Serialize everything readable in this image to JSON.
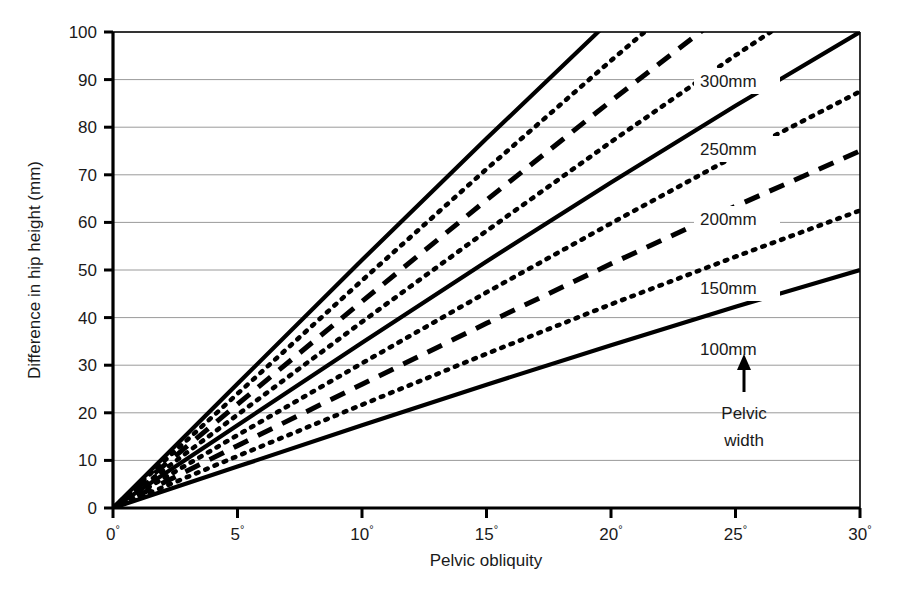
{
  "chart_data": {
    "type": "line",
    "title": "",
    "xlabel": "Pelvic obliquity",
    "ylabel": "Difference in hip height (mm)",
    "xlim": [
      0,
      30
    ],
    "ylim": [
      0,
      100
    ],
    "grid": true,
    "grid_axis": "y",
    "legend_position": "inline-right",
    "xticks": [
      "0",
      "5",
      "10",
      "15",
      "20",
      "25",
      "30"
    ],
    "xtick_values": [
      0,
      5,
      10,
      15,
      20,
      25,
      30
    ],
    "xtick_suffix": "°",
    "yticks": [
      "0",
      "10",
      "20",
      "30",
      "40",
      "50",
      "60",
      "70",
      "80",
      "90",
      "100"
    ],
    "ytick_values": [
      0,
      10,
      20,
      30,
      40,
      50,
      60,
      70,
      80,
      90,
      100
    ],
    "x": [
      0,
      5,
      10,
      15,
      20,
      25,
      30
    ],
    "series": [
      {
        "name": "300mm",
        "pelvic_width_mm": 300,
        "style": "solid",
        "label": "300mm",
        "values": [
          0,
          26.1,
          52.1,
          77.6,
          102.6,
          126.8,
          150.0
        ],
        "clipped_at_y": 100
      },
      {
        "name": "275mm",
        "pelvic_width_mm": 275,
        "style": "dotted",
        "label": "",
        "values": [
          0,
          24.0,
          47.8,
          71.2,
          94.0,
          116.2,
          137.5
        ],
        "clipped_at_y": 100
      },
      {
        "name": "250mm",
        "pelvic_width_mm": 250,
        "style": "dashed",
        "label": "250mm",
        "values": [
          0,
          21.8,
          43.4,
          64.7,
          85.5,
          105.7,
          125.0
        ],
        "clipped_at_y": 100
      },
      {
        "name": "225mm",
        "pelvic_width_mm": 225,
        "style": "dotted",
        "label": "",
        "values": [
          0,
          19.6,
          39.1,
          58.2,
          76.9,
          95.1,
          112.5
        ],
        "clipped_at_y": 100
      },
      {
        "name": "200mm",
        "pelvic_width_mm": 200,
        "style": "solid",
        "label": "200mm",
        "values": [
          0,
          17.4,
          34.7,
          51.8,
          68.4,
          84.5,
          100.0
        ],
        "clipped_at_y": 100
      },
      {
        "name": "175mm",
        "pelvic_width_mm": 175,
        "style": "dotted",
        "label": "",
        "values": [
          0,
          15.3,
          30.4,
          45.3,
          59.8,
          74.0,
          87.5
        ],
        "clipped_at_y": 100
      },
      {
        "name": "150mm",
        "pelvic_width_mm": 150,
        "style": "dashed",
        "label": "150mm",
        "values": [
          0,
          13.1,
          26.0,
          38.8,
          51.3,
          63.4,
          75.0
        ],
        "clipped_at_y": 100
      },
      {
        "name": "125mm",
        "pelvic_width_mm": 125,
        "style": "dotted",
        "label": "",
        "values": [
          0,
          10.9,
          21.7,
          32.4,
          42.8,
          52.8,
          62.5
        ],
        "clipped_at_y": 100
      },
      {
        "name": "100mm",
        "pelvic_width_mm": 100,
        "style": "solid",
        "label": "100mm",
        "values": [
          0,
          8.7,
          17.4,
          25.9,
          34.2,
          42.3,
          50.0
        ],
        "clipped_at_y": 100
      }
    ],
    "annotations": [
      {
        "name": "pelvic-width-arrow",
        "text": "↑",
        "kind": "arrow-up"
      },
      {
        "name": "pelvic-width-caption-line1",
        "text": "Pelvic"
      },
      {
        "name": "pelvic-width-caption-line2",
        "text": "width"
      }
    ]
  },
  "colors": {
    "line": "#000000",
    "grid": "#9a9a9a",
    "axis": "#000000",
    "text": "#1a1a1a",
    "background": "#ffffff"
  }
}
